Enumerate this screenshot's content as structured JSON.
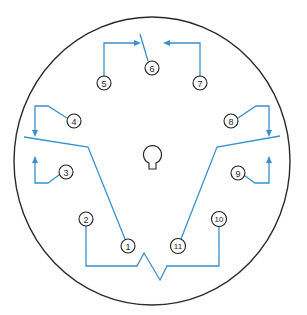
{
  "diagram": {
    "type": "11-pin relay socket wiring diagram",
    "colors": {
      "wire": "#3a90cc",
      "outline": "#2a2a2a",
      "pin_text": "#1e1e1e"
    },
    "pins": [
      {
        "id": "1",
        "label": "1",
        "cx": 128,
        "cy": 246
      },
      {
        "id": "2",
        "label": "2",
        "cx": 86,
        "cy": 219
      },
      {
        "id": "3",
        "label": "3",
        "cx": 66,
        "cy": 172
      },
      {
        "id": "4",
        "label": "4",
        "cx": 74,
        "cy": 121
      },
      {
        "id": "5",
        "label": "5",
        "cx": 104,
        "cy": 83
      },
      {
        "id": "6",
        "label": "6",
        "cx": 152,
        "cy": 68
      },
      {
        "id": "7",
        "label": "7",
        "cx": 200,
        "cy": 83
      },
      {
        "id": "8",
        "label": "8",
        "cx": 231,
        "cy": 121
      },
      {
        "id": "9",
        "label": "9",
        "cx": 238,
        "cy": 173
      },
      {
        "id": "10",
        "label": "10",
        "cx": 219,
        "cy": 219
      },
      {
        "id": "11",
        "label": "11",
        "cx": 178,
        "cy": 246
      }
    ],
    "components": {
      "outline": "circular socket base",
      "center_key": "keyhole alignment key",
      "coil": "zigzag coil between pins 2 and 10",
      "contacts": [
        "switch 1: common pin 1, NO pin 3, NC pin 4",
        "switch 2: common pin 6, NO pin 7, NC pin 5",
        "switch 3: common pin 11, NO pin 9, NC pin 8"
      ]
    }
  }
}
